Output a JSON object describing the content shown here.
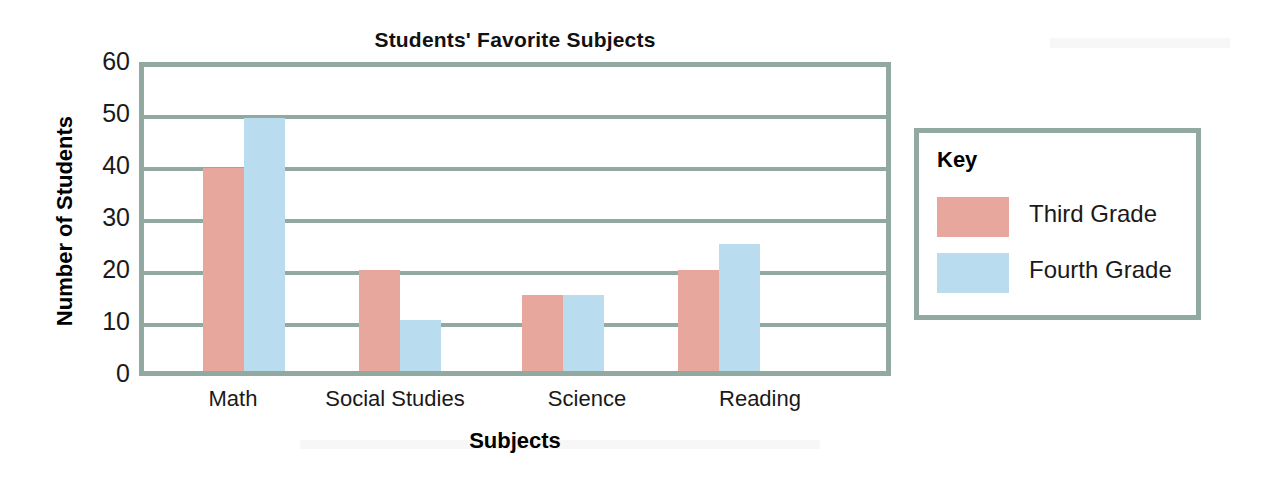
{
  "chart_data": {
    "type": "bar",
    "title": "Students' Favorite Subjects",
    "xlabel": "Subjects",
    "ylabel": "Number of Students",
    "categories": [
      "Math",
      "Social Studies",
      "Science",
      "Reading"
    ],
    "series": [
      {
        "name": "Third Grade",
        "color": "#e7a79d",
        "values": [
          40,
          20,
          15,
          20
        ]
      },
      {
        "name": "Fourth Grade",
        "color": "#b9dcef",
        "values": [
          50,
          10,
          15,
          25
        ]
      }
    ],
    "ylim": [
      0,
      60
    ],
    "yticks": [
      0,
      10,
      20,
      30,
      40,
      50,
      60
    ],
    "ytick_labels": [
      "0",
      "10",
      "20",
      "30",
      "40",
      "50",
      "60"
    ],
    "grid": true,
    "grid_axis": "y",
    "grid_color": "#92a9a1",
    "frame_color": "#92a9a1",
    "legend": {
      "title": "Key",
      "position": "right-outside",
      "entries": [
        {
          "label": "Third Grade",
          "color": "#e7a79d"
        },
        {
          "label": "Fourth Grade",
          "color": "#b9dcef"
        }
      ]
    }
  }
}
